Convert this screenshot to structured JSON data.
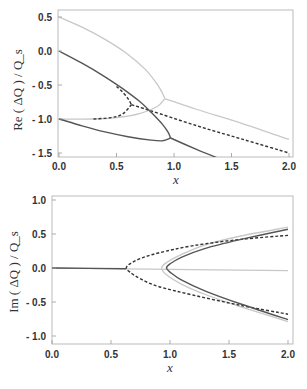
{
  "chart_data": [
    {
      "type": "line",
      "title": "",
      "xlabel": "x",
      "ylabel": "Re ( ΔQ ) / Q_s",
      "xlim": [
        0.0,
        2.0
      ],
      "ylim": [
        -1.6,
        0.6
      ],
      "xticks": [
        "0.0",
        "0.5",
        "1.0",
        "1.5",
        "2.0"
      ],
      "yticks": [
        "0.5",
        "0.0",
        "- 0.5",
        "- 1.0",
        "- 1.5"
      ],
      "grid": false,
      "legend": null,
      "series": [
        {
          "name": "light-grey-upper",
          "style": "solid",
          "color": "#c8c8c8",
          "points": [
            [
              0.0,
              0.5
            ],
            [
              0.2,
              0.35
            ],
            [
              0.4,
              0.17
            ],
            [
              0.6,
              -0.05
            ],
            [
              0.75,
              -0.27
            ],
            [
              0.85,
              -0.48
            ],
            [
              0.9,
              -0.62
            ],
            [
              0.92,
              -0.7
            ]
          ]
        },
        {
          "name": "light-grey-lower",
          "style": "solid",
          "color": "#c8c8c8",
          "points": [
            [
              0.0,
              -1.0
            ],
            [
              0.3,
              -1.0
            ],
            [
              0.5,
              -0.98
            ],
            [
              0.7,
              -0.92
            ],
            [
              0.85,
              -0.82
            ],
            [
              0.92,
              -0.7
            ]
          ]
        },
        {
          "name": "light-grey-tail",
          "style": "solid",
          "color": "#c8c8c8",
          "points": [
            [
              0.92,
              -0.7
            ],
            [
              1.2,
              -0.86
            ],
            [
              1.6,
              -1.07
            ],
            [
              2.0,
              -1.3
            ]
          ]
        },
        {
          "name": "dark-upper",
          "style": "solid",
          "color": "#555555",
          "points": [
            [
              0.0,
              0.0
            ],
            [
              0.2,
              -0.18
            ],
            [
              0.4,
              -0.38
            ],
            [
              0.55,
              -0.55
            ],
            [
              0.7,
              -0.74
            ],
            [
              0.8,
              -0.9
            ],
            [
              0.9,
              -1.08
            ],
            [
              0.95,
              -1.2
            ],
            [
              0.97,
              -1.28
            ]
          ]
        },
        {
          "name": "dark-lower",
          "style": "solid",
          "color": "#555555",
          "points": [
            [
              0.0,
              -1.0
            ],
            [
              0.2,
              -1.1
            ],
            [
              0.4,
              -1.19
            ],
            [
              0.6,
              -1.26
            ],
            [
              0.8,
              -1.31
            ],
            [
              0.9,
              -1.32
            ],
            [
              0.97,
              -1.28
            ]
          ]
        },
        {
          "name": "dark-tail",
          "style": "solid",
          "color": "#555555",
          "points": [
            [
              0.97,
              -1.28
            ],
            [
              1.2,
              -1.45
            ],
            [
              1.45,
              -1.62
            ]
          ]
        },
        {
          "name": "dashed-upper",
          "style": "dashed",
          "color": "#333333",
          "points": [
            [
              0.5,
              -0.52
            ],
            [
              0.55,
              -0.6
            ],
            [
              0.6,
              -0.7
            ],
            [
              0.63,
              -0.79
            ]
          ]
        },
        {
          "name": "dashed-lower",
          "style": "dashed",
          "color": "#333333",
          "points": [
            [
              0.3,
              -1.0
            ],
            [
              0.45,
              -0.98
            ],
            [
              0.55,
              -0.93
            ],
            [
              0.63,
              -0.79
            ]
          ]
        },
        {
          "name": "dashed-tail",
          "style": "dashed",
          "color": "#333333",
          "points": [
            [
              0.63,
              -0.79
            ],
            [
              0.8,
              -0.88
            ],
            [
              1.2,
              -1.1
            ],
            [
              1.6,
              -1.3
            ],
            [
              2.0,
              -1.5
            ]
          ]
        }
      ]
    },
    {
      "type": "line",
      "title": "",
      "xlabel": "x",
      "ylabel": "Im ( ΔQ ) / Q_s",
      "xlim": [
        0.0,
        2.0
      ],
      "ylim": [
        -1.1,
        1.05
      ],
      "xticks": [
        "0.0",
        "0.5",
        "1.0",
        "1.5",
        "2.0"
      ],
      "yticks": [
        "1.0",
        "0.5",
        "0.0",
        "- 0.5",
        "- 1.0"
      ],
      "grid": false,
      "legend": null,
      "series": [
        {
          "name": "light-grey-flat",
          "style": "solid",
          "color": "#c8c8c8",
          "points": [
            [
              0.0,
              0.0
            ],
            [
              1.0,
              -0.02
            ],
            [
              2.0,
              -0.04
            ]
          ]
        },
        {
          "name": "dark-flat",
          "style": "solid",
          "color": "#555555",
          "points": [
            [
              0.0,
              0.0
            ],
            [
              0.63,
              -0.01
            ]
          ]
        },
        {
          "name": "dashed-branch",
          "style": "dashed",
          "color": "#333333",
          "points": [
            [
              2.0,
              0.48
            ],
            [
              1.6,
              0.42
            ],
            [
              1.2,
              0.33
            ],
            [
              0.9,
              0.22
            ],
            [
              0.75,
              0.14
            ],
            [
              0.66,
              0.06
            ],
            [
              0.63,
              0.0
            ],
            [
              0.66,
              -0.06
            ],
            [
              0.75,
              -0.16
            ],
            [
              0.9,
              -0.27
            ],
            [
              1.2,
              -0.4
            ],
            [
              1.6,
              -0.55
            ],
            [
              2.0,
              -0.68
            ]
          ]
        },
        {
          "name": "light-grey-branch",
          "style": "solid",
          "color": "#c8c8c8",
          "points": [
            [
              2.0,
              0.6
            ],
            [
              1.6,
              0.47
            ],
            [
              1.3,
              0.34
            ],
            [
              1.1,
              0.2
            ],
            [
              0.97,
              0.08
            ],
            [
              0.93,
              0.0
            ],
            [
              0.97,
              -0.1
            ],
            [
              1.1,
              -0.24
            ],
            [
              1.3,
              -0.39
            ],
            [
              1.6,
              -0.57
            ],
            [
              2.0,
              -0.79
            ]
          ]
        },
        {
          "name": "dark-branch",
          "style": "solid",
          "color": "#555555",
          "points": [
            [
              2.0,
              0.57
            ],
            [
              1.6,
              0.42
            ],
            [
              1.3,
              0.29
            ],
            [
              1.1,
              0.16
            ],
            [
              1.0,
              0.06
            ],
            [
              0.97,
              0.0
            ],
            [
              1.0,
              -0.06
            ],
            [
              1.1,
              -0.18
            ],
            [
              1.3,
              -0.34
            ],
            [
              1.6,
              -0.53
            ],
            [
              2.0,
              -0.76
            ]
          ]
        }
      ]
    }
  ]
}
